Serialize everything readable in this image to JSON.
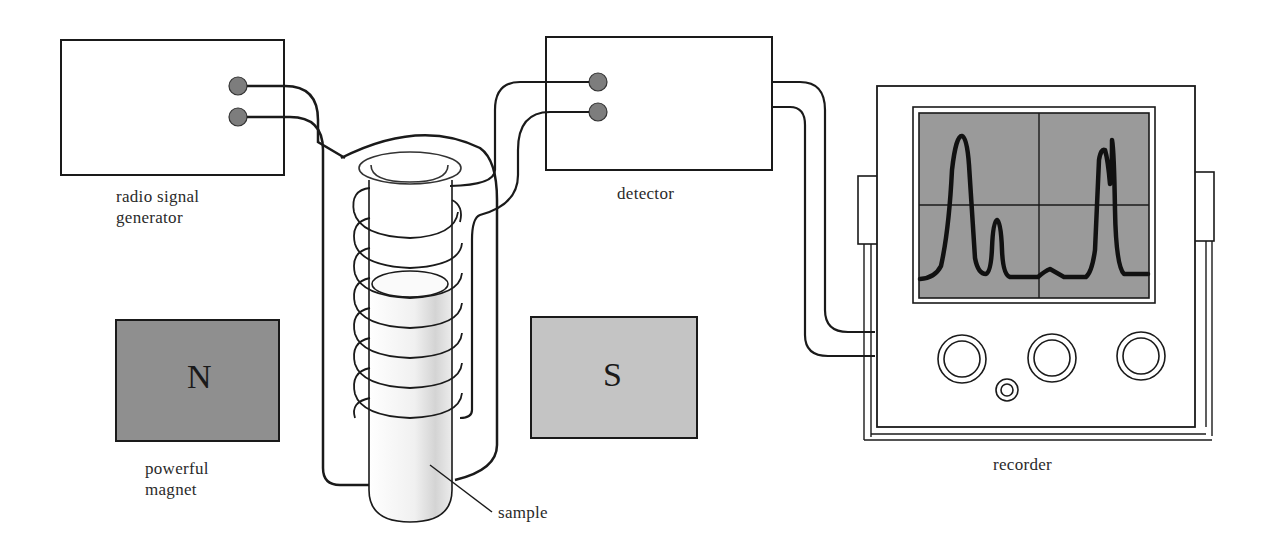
{
  "labels": {
    "generator_line1": "radio signal",
    "generator_line2": "generator",
    "detector": "detector",
    "magnet_line1": "powerful",
    "magnet_line2": "magnet",
    "sample": "sample",
    "recorder": "recorder",
    "north_pole": "N",
    "south_pole": "S"
  },
  "colors": {
    "line": "#1a1a1a",
    "north_magnet": "#8f8f8f",
    "south_magnet": "#c4c4c4",
    "screen": "#9a9a9a",
    "terminal": "#7d7d7d",
    "background": "#ffffff"
  },
  "components": [
    {
      "name": "radio signal generator",
      "terminals": 2
    },
    {
      "name": "detector",
      "terminals": 2
    },
    {
      "name": "powerful magnet",
      "poles": [
        "N",
        "S"
      ]
    },
    {
      "name": "sample tube with coil",
      "coil_turns": 8
    },
    {
      "name": "recorder",
      "knobs": 4,
      "screen_peaks": 4
    }
  ]
}
